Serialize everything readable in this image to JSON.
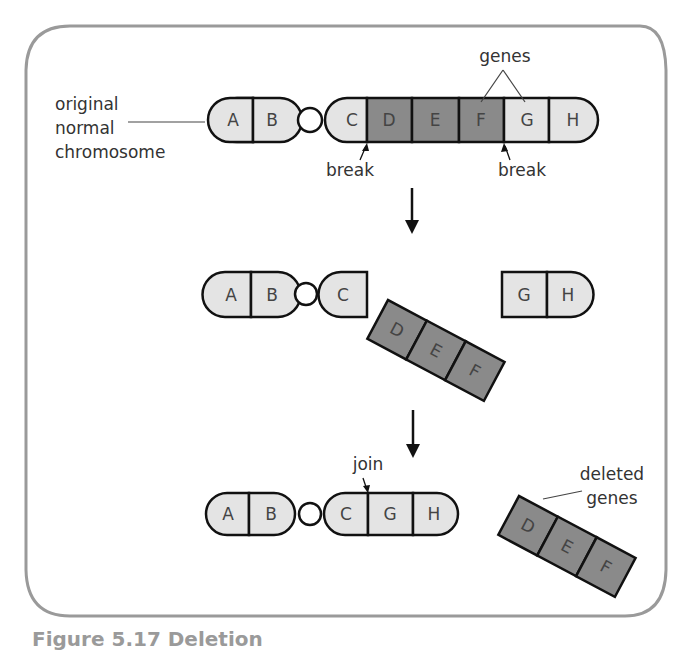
{
  "figure": {
    "caption": "Figure 5.17 Deletion",
    "colors": {
      "frame": "#9a9a9a",
      "light_gene": "#e4e4e4",
      "dark_gene": "#8a8a8a",
      "outline": "#111111",
      "text": "#3a3a3a"
    }
  },
  "labels": {
    "original_line1": "original",
    "original_line2": "normal",
    "original_line3": "chromosome",
    "genes": "genes",
    "break_left": "break",
    "break_right": "break",
    "join": "join",
    "deleted_line1": "deleted",
    "deleted_line2": "genes"
  },
  "stage1": {
    "description": "original normal chromosome",
    "genes": [
      "A",
      "B",
      "C",
      "D",
      "E",
      "F",
      "G",
      "H"
    ],
    "deleted_segment": [
      "D",
      "E",
      "F"
    ]
  },
  "stage2": {
    "left_fragment": [
      "A",
      "B",
      "C"
    ],
    "middle_fragment": [
      "D",
      "E",
      "F"
    ],
    "right_fragment": [
      "G",
      "H"
    ]
  },
  "stage3": {
    "rejoined_chromosome": [
      "A",
      "B",
      "C",
      "G",
      "H"
    ],
    "deleted_fragment": [
      "D",
      "E",
      "F"
    ]
  },
  "letters": {
    "s1": [
      "A",
      "B",
      "C",
      "D",
      "E",
      "F",
      "G",
      "H"
    ],
    "s2a": [
      "A",
      "B",
      "C"
    ],
    "s2m": [
      "D",
      "E",
      "F"
    ],
    "s2r": [
      "G",
      "H"
    ],
    "s3a": [
      "A",
      "B",
      "C",
      "G",
      "H"
    ],
    "s3d": [
      "D",
      "E",
      "F"
    ]
  }
}
